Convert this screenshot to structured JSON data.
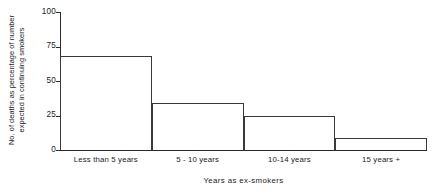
{
  "chart_data": {
    "type": "bar",
    "title": "",
    "categories": [
      "Less than 5 years",
      "5 - 10 years",
      "10-14 years",
      "15 years +"
    ],
    "values": [
      68,
      34,
      25,
      9
    ],
    "xlabel": "Years as ex-smokers",
    "ylabel_line1": "No. of deaths as percentage of number",
    "ylabel_line2": "expected in continuing smokers",
    "ylim": [
      0,
      100
    ],
    "yticks": [
      0,
      25,
      50,
      75,
      100
    ],
    "ytick_labels": [
      "0",
      "25",
      "50",
      "75",
      "100"
    ],
    "grid": false,
    "legend": "none",
    "bar_fill": "#ffffff",
    "bar_edge": "#3a3a3a",
    "axis_color": "#2b2b2b"
  }
}
